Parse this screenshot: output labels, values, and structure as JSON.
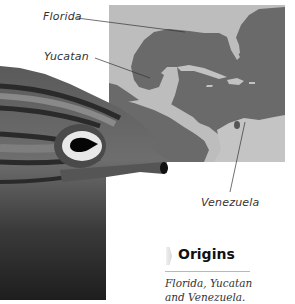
{
  "map": {
    "labels": {
      "florida": "Florida",
      "yucatan": "Yucatan",
      "venezuela": "Venezuela"
    },
    "colors": {
      "sea": "#6a6a6a",
      "land": "#bcbcbc"
    }
  },
  "origins": {
    "title": "Origins",
    "text_line1": "Florida, Yucatan",
    "text_line2": "and Venezuela."
  }
}
